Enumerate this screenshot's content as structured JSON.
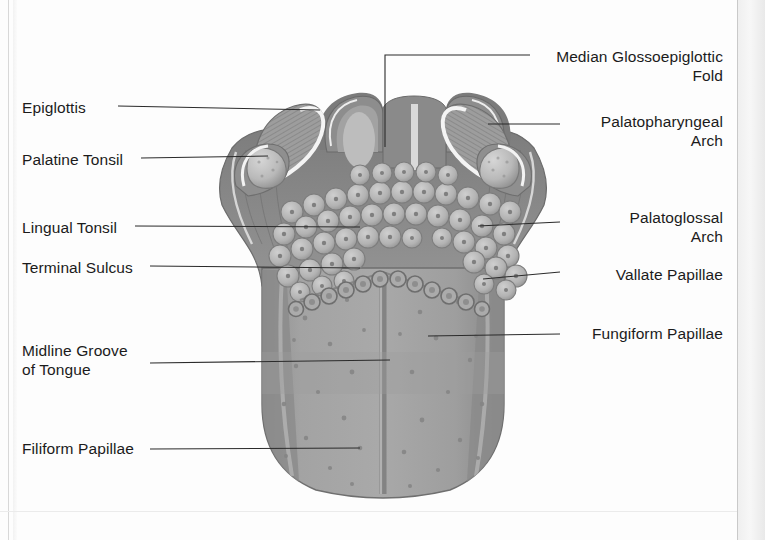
{
  "diagram": {
    "palette": {
      "tongue_body": "#9a9a9a",
      "tongue_body_light": "#a8a8a8",
      "tongue_outline": "#6f6f6f",
      "root_dark": "#6e6e6e",
      "papilla_fill": "#b4b4b4",
      "papilla_edge": "#808080",
      "tonsil_fill": "#b0b0b0",
      "highlight": "#f2f2f2",
      "epiglottis_fill": "#8d8d8d",
      "leader_line": "#2b2b2b",
      "label_text": "#1b1b1b",
      "page_background": "#fdfdfd"
    },
    "labels_left": [
      {
        "id": "epiglottis",
        "text": "Epiglottis",
        "x": 22,
        "y": 98
      },
      {
        "id": "palatine-tonsil",
        "text": "Palatine Tonsil",
        "x": 22,
        "y": 150
      },
      {
        "id": "lingual-tonsil",
        "text": "Lingual Tonsil",
        "x": 22,
        "y": 218
      },
      {
        "id": "terminal-sulcus",
        "text": "Terminal Sulcus",
        "x": 22,
        "y": 258
      },
      {
        "id": "midline-groove",
        "text": "Midline Groove\nof Tongue",
        "x": 22,
        "y": 341
      },
      {
        "id": "filiform-papillae",
        "text": "Filiform Papillae",
        "x": 22,
        "y": 439
      }
    ],
    "labels_right": [
      {
        "id": "median-glossoepiglottic-fold",
        "text": "Median Glossoepiglottic\nFold",
        "right": 42,
        "y": 47
      },
      {
        "id": "palatopharyngeal-arch",
        "text": "Palatopharyngeal\nArch",
        "right": 42,
        "y": 112
      },
      {
        "id": "palatoglossal-arch",
        "text": "Palatoglossal\nArch",
        "right": 42,
        "y": 208
      },
      {
        "id": "vallate-papillae",
        "text": "Vallate Papillae",
        "right": 42,
        "y": 265
      },
      {
        "id": "fungiform-papillae",
        "text": "Fungiform Papillae",
        "right": 42,
        "y": 324
      }
    ],
    "leaders": [
      {
        "id": "leader-epiglottis",
        "points": "118,106 320,110"
      },
      {
        "id": "leader-palatine-tonsil",
        "points": "141,158 268,156"
      },
      {
        "id": "leader-lingual-tonsil",
        "points": "135,226 360,227"
      },
      {
        "id": "leader-terminal-sulcus",
        "points": "150,266 360,268"
      },
      {
        "id": "leader-midline-groove",
        "points": "150,363 390,360"
      },
      {
        "id": "leader-filiform",
        "points": "150,449 360,448"
      },
      {
        "id": "leader-fold",
        "points": "530,55 385,55 385,147"
      },
      {
        "id": "leader-palatopharyngeal",
        "points": "560,124 488,124"
      },
      {
        "id": "leader-palatoglossal",
        "points": "560,222 478,226"
      },
      {
        "id": "leader-vallate",
        "points": "560,272 483,279"
      },
      {
        "id": "leader-fungiform",
        "points": "560,334 428,336"
      }
    ]
  }
}
